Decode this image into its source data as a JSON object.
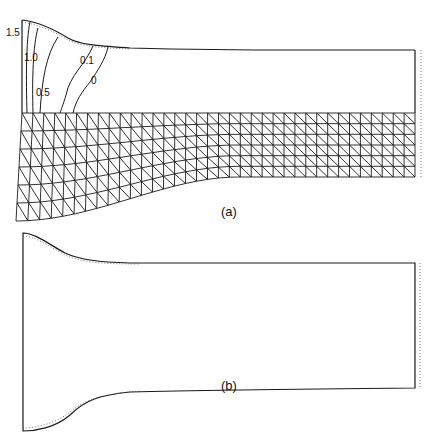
{
  "figure": {
    "panel_a": {
      "label": "(a)",
      "label_pos": [
        229,
        212
      ],
      "outline": {
        "top_edge": [
          [
            22,
            20
          ],
          [
            40,
            24
          ],
          [
            58,
            33
          ],
          [
            70,
            40
          ],
          [
            80,
            43
          ],
          [
            100,
            46
          ],
          [
            120,
            48
          ],
          [
            160,
            49
          ],
          [
            200,
            50
          ],
          [
            260,
            50
          ],
          [
            300,
            50
          ],
          [
            415,
            50
          ]
        ],
        "right_x": 415,
        "left_x": 22,
        "top_y_left": 20,
        "mesh_top_y": 113,
        "bottom_y_right": 177
      },
      "contours": [
        {
          "value": "1.5",
          "label": "1.5",
          "label_pos": [
            8,
            32
          ]
        },
        {
          "value": "1.0",
          "label": "1.0",
          "label_pos": [
            23,
            60
          ]
        },
        {
          "value": "0.5",
          "label": "0.5",
          "label_pos": [
            36,
            96
          ]
        },
        {
          "value": "0.1",
          "label": "0.1",
          "label_pos": [
            78,
            64
          ]
        },
        {
          "value": "0",
          "label": "0",
          "label_pos": [
            90,
            83
          ]
        }
      ],
      "mesh": {
        "columns": 36,
        "rows": 6,
        "x_start": 22,
        "x_end": 415,
        "top_y": 113,
        "bottom_right_y": 177,
        "bottom_left_y": 221
      }
    },
    "panel_b": {
      "label": "(b)",
      "label_pos": [
        229,
        386
      ],
      "outline": {
        "left_x": 23,
        "right_x": 415,
        "top_left_y": 233,
        "top_right_y": 263,
        "bottom_left_y": 431,
        "bottom_right_y": 388
      }
    },
    "colors": {
      "line": "#1a1a1a",
      "dotted": "#555555",
      "background": "#ffffff"
    }
  }
}
